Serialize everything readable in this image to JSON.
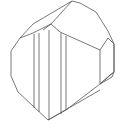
{
  "diagram": {
    "type": "crystal-line-drawing",
    "stroke_color": "#555555",
    "background": "#ffffff"
  }
}
